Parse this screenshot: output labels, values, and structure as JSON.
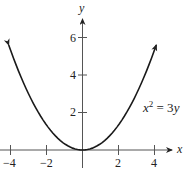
{
  "chart_data": {
    "type": "line",
    "title": "",
    "equation": "x^2 = 3y",
    "xlabel": "x",
    "ylabel": "y",
    "xlim": [
      -4.5,
      5
    ],
    "ylim": [
      -0.5,
      7.5
    ],
    "x_ticks": [
      -4,
      -2,
      2,
      4
    ],
    "y_ticks": [
      2,
      4,
      6
    ],
    "x_tick_labels": [
      "-4",
      "-2",
      "2",
      "4"
    ],
    "y_tick_labels": [
      "2",
      "4",
      "6"
    ],
    "grid": false,
    "legend": null,
    "series": [
      {
        "name": "x^2 = 3y",
        "x": [
          -4.1,
          -3,
          -2,
          -1,
          0,
          1,
          2,
          3,
          4.1
        ],
        "y": [
          5.6,
          3,
          1.333,
          0.333,
          0,
          0.333,
          1.333,
          3,
          5.6
        ],
        "arrows_at_ends": true
      }
    ],
    "annotations": [
      {
        "text": "x^2 = 3y",
        "x": 3.5,
        "y": 2.1
      }
    ]
  },
  "labels": {
    "x_axis": "x",
    "y_axis": "y",
    "equation_base": "x",
    "equation_exp": "2",
    "equation_rest": " = 3",
    "equation_var": "y",
    "xt": [
      "−4",
      "−2",
      "2",
      "4"
    ],
    "yt": [
      "6",
      "4",
      "2"
    ]
  },
  "colors": {
    "curve": "#1a1a1a",
    "axis": "#555555"
  }
}
